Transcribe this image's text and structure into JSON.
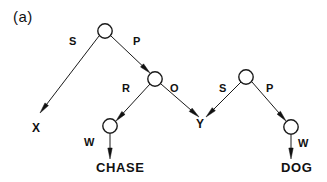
{
  "figure": {
    "panel_label": "(a)",
    "width": 327,
    "height": 182,
    "background_color": "#ffffff",
    "ink_color": "#111111"
  },
  "nodes": [
    {
      "id": "n1",
      "kind": "circle",
      "cx": 105,
      "cy": 31,
      "r": 7.2,
      "label": ""
    },
    {
      "id": "n2",
      "kind": "circle",
      "cx": 155,
      "cy": 79,
      "r": 7.2,
      "label": ""
    },
    {
      "id": "n3",
      "kind": "circle",
      "cx": 110,
      "cy": 126,
      "r": 7.2,
      "label": ""
    },
    {
      "id": "n4",
      "kind": "circle",
      "cx": 246,
      "cy": 77,
      "r": 7.2,
      "label": ""
    },
    {
      "id": "n5",
      "kind": "circle",
      "cx": 291,
      "cy": 127,
      "r": 7.2,
      "label": ""
    }
  ],
  "terminals": [
    {
      "id": "t_x",
      "text": "X",
      "x": 32,
      "y": 122
    },
    {
      "id": "t_y",
      "text": "Y",
      "x": 196,
      "y": 118
    },
    {
      "id": "t_chase",
      "text": "CHASE",
      "x": 96,
      "y": 161
    },
    {
      "id": "t_dog",
      "text": "DOG",
      "x": 281,
      "y": 161
    }
  ],
  "arcs": [
    {
      "id": "a_s1",
      "label": "S",
      "from": "n1",
      "to": "X",
      "label_x": 69,
      "label_y": 36
    },
    {
      "id": "a_p1",
      "label": "P",
      "from": "n1",
      "to": "n2",
      "label_x": 133,
      "label_y": 36
    },
    {
      "id": "a_r",
      "label": "R",
      "from": "n2",
      "to": "n3",
      "label_x": 122,
      "label_y": 83
    },
    {
      "id": "a_o",
      "label": "O",
      "from": "n2",
      "to": "Y",
      "label_x": 170,
      "label_y": 83
    },
    {
      "id": "a_s2",
      "label": "S",
      "from": "n4",
      "to": "Y",
      "label_x": 219,
      "label_y": 83
    },
    {
      "id": "a_p2",
      "label": "P",
      "from": "n4",
      "to": "n5",
      "label_x": 266,
      "label_y": 83
    },
    {
      "id": "a_w1",
      "label": "W",
      "from": "n3",
      "to": "CHASE",
      "label_x": 84,
      "label_y": 137
    },
    {
      "id": "a_w2",
      "label": "W",
      "from": "n5",
      "to": "DOG",
      "label_x": 298,
      "label_y": 138
    }
  ],
  "geometry": {
    "edges": [
      {
        "id": "e_s1",
        "x1": 99,
        "y1": 36,
        "x2": 40,
        "y2": 113,
        "arrow": true
      },
      {
        "id": "e_p1",
        "x1": 111,
        "y1": 36,
        "x2": 150,
        "y2": 73,
        "arrow": true
      },
      {
        "id": "e_r",
        "x1": 150,
        "y1": 84,
        "x2": 116,
        "y2": 121,
        "arrow": true
      },
      {
        "id": "e_o",
        "x1": 161,
        "y1": 84,
        "x2": 199,
        "y2": 117,
        "arrow": true
      },
      {
        "id": "e_s2",
        "x1": 241,
        "y1": 82,
        "x2": 206,
        "y2": 117,
        "arrow": true
      },
      {
        "id": "e_p2",
        "x1": 252,
        "y1": 82,
        "x2": 286,
        "y2": 121,
        "arrow": true
      },
      {
        "id": "e_w1",
        "x1": 110,
        "y1": 134,
        "x2": 110,
        "y2": 159,
        "arrow": true
      },
      {
        "id": "e_w2",
        "x1": 291,
        "y1": 135,
        "x2": 291,
        "y2": 159,
        "arrow": true
      }
    ],
    "arrow_length": 11,
    "arrow_width": 4.4
  }
}
